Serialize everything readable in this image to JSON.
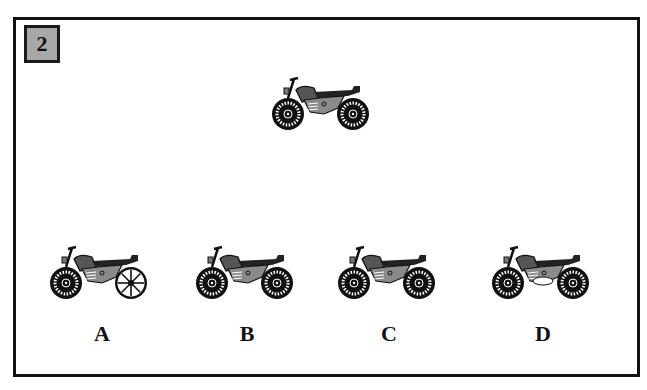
{
  "question": {
    "number": "2",
    "reference_image": "motorcycle-icon",
    "options": [
      {
        "label": "A",
        "variant": "spoked-rear-wheel"
      },
      {
        "label": "B",
        "variant": "identical"
      },
      {
        "label": "C",
        "variant": "identical"
      },
      {
        "label": "D",
        "variant": "white-engine-bottom"
      }
    ]
  },
  "colors": {
    "frame": "#111111",
    "badge_fill": "#a8a8a8",
    "tire": "#111111",
    "tank": "#555555",
    "body": "#8a8a8a"
  }
}
